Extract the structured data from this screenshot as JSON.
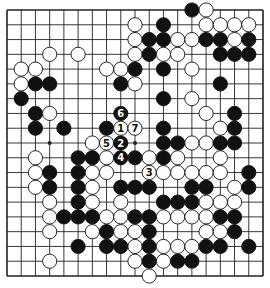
{
  "diagram": {
    "type": "go-board",
    "size": 19,
    "colors": {
      "black": "#111111",
      "white": "#ffffff",
      "line": "#222222"
    },
    "star_points": [
      [
        3,
        3
      ],
      [
        9,
        3
      ],
      [
        15,
        3
      ],
      [
        3,
        9
      ],
      [
        9,
        9
      ],
      [
        15,
        9
      ],
      [
        3,
        15
      ],
      [
        9,
        15
      ],
      [
        15,
        15
      ]
    ],
    "stones": [
      {
        "c": 13,
        "r": 0,
        "color": "B"
      },
      {
        "c": 14,
        "r": 0,
        "color": "W"
      },
      {
        "c": 9,
        "r": 1,
        "color": "W"
      },
      {
        "c": 11,
        "r": 1,
        "color": "B"
      },
      {
        "c": 14,
        "r": 1,
        "color": "W"
      },
      {
        "c": 15,
        "r": 1,
        "color": "W"
      },
      {
        "c": 16,
        "r": 1,
        "color": "W"
      },
      {
        "c": 17,
        "r": 1,
        "color": "W"
      },
      {
        "c": 9,
        "r": 2,
        "color": "W"
      },
      {
        "c": 10,
        "r": 2,
        "color": "B"
      },
      {
        "c": 11,
        "r": 2,
        "color": "B"
      },
      {
        "c": 12,
        "r": 2,
        "color": "W"
      },
      {
        "c": 13,
        "r": 2,
        "color": "W"
      },
      {
        "c": 14,
        "r": 2,
        "color": "B"
      },
      {
        "c": 15,
        "r": 2,
        "color": "B"
      },
      {
        "c": 16,
        "r": 2,
        "color": "W"
      },
      {
        "c": 17,
        "r": 2,
        "color": "B"
      },
      {
        "c": 3,
        "r": 3,
        "color": "W"
      },
      {
        "c": 5,
        "r": 3,
        "color": "W"
      },
      {
        "c": 9,
        "r": 3,
        "color": "W"
      },
      {
        "c": 10,
        "r": 3,
        "color": "B"
      },
      {
        "c": 11,
        "r": 3,
        "color": "W"
      },
      {
        "c": 12,
        "r": 3,
        "color": "W"
      },
      {
        "c": 15,
        "r": 3,
        "color": "B"
      },
      {
        "c": 16,
        "r": 3,
        "color": "B"
      },
      {
        "c": 17,
        "r": 3,
        "color": "B"
      },
      {
        "c": 1,
        "r": 4,
        "color": "W"
      },
      {
        "c": 2,
        "r": 4,
        "color": "W"
      },
      {
        "c": 7,
        "r": 4,
        "color": "W"
      },
      {
        "c": 8,
        "r": 4,
        "color": "W"
      },
      {
        "c": 9,
        "r": 4,
        "color": "B"
      },
      {
        "c": 11,
        "r": 4,
        "color": "B"
      },
      {
        "c": 13,
        "r": 4,
        "color": "W"
      },
      {
        "c": 1,
        "r": 5,
        "color": "W"
      },
      {
        "c": 2,
        "r": 5,
        "color": "B"
      },
      {
        "c": 3,
        "r": 5,
        "color": "B"
      },
      {
        "c": 8,
        "r": 5,
        "color": "B"
      },
      {
        "c": 9,
        "r": 5,
        "color": "W"
      },
      {
        "c": 15,
        "r": 5,
        "color": "B"
      },
      {
        "c": 1,
        "r": 6,
        "color": "B"
      },
      {
        "c": 11,
        "r": 6,
        "color": "B"
      },
      {
        "c": 13,
        "r": 6,
        "color": "W"
      },
      {
        "c": 2,
        "r": 7,
        "color": "B"
      },
      {
        "c": 3,
        "r": 7,
        "color": "W"
      },
      {
        "c": 8,
        "r": 7,
        "color": "B",
        "label": "6"
      },
      {
        "c": 14,
        "r": 7,
        "color": "W"
      },
      {
        "c": 16,
        "r": 7,
        "color": "B"
      },
      {
        "c": 2,
        "r": 8,
        "color": "B"
      },
      {
        "c": 4,
        "r": 8,
        "color": "B"
      },
      {
        "c": 7,
        "r": 8,
        "color": "B"
      },
      {
        "c": 8,
        "r": 8,
        "color": "W",
        "label": "1"
      },
      {
        "c": 9,
        "r": 8,
        "color": "W",
        "label": "7"
      },
      {
        "c": 11,
        "r": 8,
        "color": "B"
      },
      {
        "c": 15,
        "r": 8,
        "color": "W"
      },
      {
        "c": 16,
        "r": 8,
        "color": "B"
      },
      {
        "c": 6,
        "r": 9,
        "color": "W"
      },
      {
        "c": 7,
        "r": 9,
        "color": "W",
        "label": "5"
      },
      {
        "c": 8,
        "r": 9,
        "color": "B",
        "label": "2"
      },
      {
        "c": 11,
        "r": 9,
        "color": "B"
      },
      {
        "c": 12,
        "r": 9,
        "color": "B"
      },
      {
        "c": 13,
        "r": 9,
        "color": "W"
      },
      {
        "c": 14,
        "r": 9,
        "color": "W"
      },
      {
        "c": 15,
        "r": 9,
        "color": "B"
      },
      {
        "c": 16,
        "r": 9,
        "color": "B"
      },
      {
        "c": 2,
        "r": 10,
        "color": "W"
      },
      {
        "c": 5,
        "r": 10,
        "color": "B"
      },
      {
        "c": 6,
        "r": 10,
        "color": "B"
      },
      {
        "c": 7,
        "r": 10,
        "color": "W"
      },
      {
        "c": 8,
        "r": 10,
        "color": "B",
        "label": "4"
      },
      {
        "c": 9,
        "r": 10,
        "color": "B"
      },
      {
        "c": 10,
        "r": 10,
        "color": "W"
      },
      {
        "c": 11,
        "r": 10,
        "color": "B"
      },
      {
        "c": 12,
        "r": 10,
        "color": "W"
      },
      {
        "c": 15,
        "r": 10,
        "color": "W"
      },
      {
        "c": 2,
        "r": 11,
        "color": "W"
      },
      {
        "c": 3,
        "r": 11,
        "color": "B"
      },
      {
        "c": 5,
        "r": 11,
        "color": "B"
      },
      {
        "c": 6,
        "r": 11,
        "color": "W"
      },
      {
        "c": 7,
        "r": 11,
        "color": "W"
      },
      {
        "c": 10,
        "r": 11,
        "color": "W",
        "label": "3"
      },
      {
        "c": 11,
        "r": 11,
        "color": "W"
      },
      {
        "c": 12,
        "r": 11,
        "color": "W"
      },
      {
        "c": 13,
        "r": 11,
        "color": "W"
      },
      {
        "c": 14,
        "r": 11,
        "color": "W"
      },
      {
        "c": 15,
        "r": 11,
        "color": "W"
      },
      {
        "c": 17,
        "r": 11,
        "color": "B"
      },
      {
        "c": 2,
        "r": 12,
        "color": "W"
      },
      {
        "c": 3,
        "r": 12,
        "color": "B"
      },
      {
        "c": 5,
        "r": 12,
        "color": "B"
      },
      {
        "c": 6,
        "r": 12,
        "color": "W"
      },
      {
        "c": 8,
        "r": 12,
        "color": "B"
      },
      {
        "c": 9,
        "r": 12,
        "color": "B"
      },
      {
        "c": 10,
        "r": 12,
        "color": "B"
      },
      {
        "c": 13,
        "r": 12,
        "color": "B"
      },
      {
        "c": 14,
        "r": 12,
        "color": "B"
      },
      {
        "c": 16,
        "r": 12,
        "color": "W"
      },
      {
        "c": 17,
        "r": 12,
        "color": "B"
      },
      {
        "c": 3,
        "r": 13,
        "color": "W"
      },
      {
        "c": 5,
        "r": 13,
        "color": "B"
      },
      {
        "c": 6,
        "r": 13,
        "color": "W"
      },
      {
        "c": 8,
        "r": 13,
        "color": "W"
      },
      {
        "c": 11,
        "r": 13,
        "color": "B"
      },
      {
        "c": 12,
        "r": 13,
        "color": "B"
      },
      {
        "c": 13,
        "r": 13,
        "color": "B"
      },
      {
        "c": 14,
        "r": 13,
        "color": "W"
      },
      {
        "c": 15,
        "r": 13,
        "color": "W"
      },
      {
        "c": 16,
        "r": 13,
        "color": "W"
      },
      {
        "c": 3,
        "r": 14,
        "color": "W"
      },
      {
        "c": 4,
        "r": 14,
        "color": "B"
      },
      {
        "c": 5,
        "r": 14,
        "color": "B"
      },
      {
        "c": 6,
        "r": 14,
        "color": "B"
      },
      {
        "c": 7,
        "r": 14,
        "color": "W"
      },
      {
        "c": 8,
        "r": 14,
        "color": "W"
      },
      {
        "c": 9,
        "r": 14,
        "color": "B"
      },
      {
        "c": 10,
        "r": 14,
        "color": "B"
      },
      {
        "c": 11,
        "r": 14,
        "color": "W"
      },
      {
        "c": 12,
        "r": 14,
        "color": "W"
      },
      {
        "c": 13,
        "r": 14,
        "color": "W"
      },
      {
        "c": 14,
        "r": 14,
        "color": "W"
      },
      {
        "c": 15,
        "r": 14,
        "color": "B"
      },
      {
        "c": 16,
        "r": 14,
        "color": "B"
      },
      {
        "c": 3,
        "r": 15,
        "color": "W"
      },
      {
        "c": 6,
        "r": 15,
        "color": "W"
      },
      {
        "c": 7,
        "r": 15,
        "color": "B"
      },
      {
        "c": 8,
        "r": 15,
        "color": "W"
      },
      {
        "c": 9,
        "r": 15,
        "color": "W"
      },
      {
        "c": 10,
        "r": 15,
        "color": "B"
      },
      {
        "c": 14,
        "r": 15,
        "color": "W"
      },
      {
        "c": 15,
        "r": 15,
        "color": "W"
      },
      {
        "c": 16,
        "r": 15,
        "color": "B"
      },
      {
        "c": 5,
        "r": 16,
        "color": "B"
      },
      {
        "c": 7,
        "r": 16,
        "color": "B"
      },
      {
        "c": 8,
        "r": 16,
        "color": "B"
      },
      {
        "c": 9,
        "r": 16,
        "color": "W"
      },
      {
        "c": 10,
        "r": 16,
        "color": "B"
      },
      {
        "c": 11,
        "r": 16,
        "color": "W"
      },
      {
        "c": 12,
        "r": 16,
        "color": "W"
      },
      {
        "c": 13,
        "r": 16,
        "color": "W"
      },
      {
        "c": 14,
        "r": 16,
        "color": "B"
      },
      {
        "c": 15,
        "r": 16,
        "color": "B"
      },
      {
        "c": 17,
        "r": 16,
        "color": "B"
      },
      {
        "c": 3,
        "r": 17,
        "color": "W"
      },
      {
        "c": 9,
        "r": 17,
        "color": "W"
      },
      {
        "c": 10,
        "r": 17,
        "color": "B"
      },
      {
        "c": 11,
        "r": 17,
        "color": "W"
      },
      {
        "c": 12,
        "r": 17,
        "color": "B"
      },
      {
        "c": 13,
        "r": 17,
        "color": "B"
      },
      {
        "c": 10,
        "r": 18,
        "color": "W"
      }
    ]
  }
}
